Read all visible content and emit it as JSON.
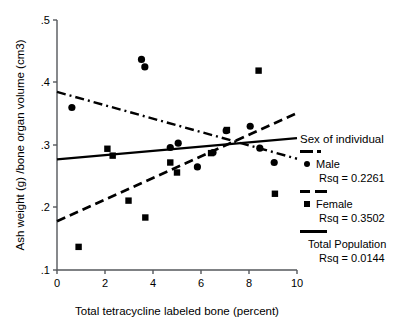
{
  "chart_data": {
    "type": "scatter",
    "title": "",
    "xlabel": "Total tetracycline labeled bone (percent)",
    "ylabel": "Ash weight (g) /bone organ volume (cm3)",
    "xlim": [
      0,
      10
    ],
    "ylim": [
      0.1,
      0.5
    ],
    "xticks": [
      "0",
      "2",
      "4",
      "6",
      "8",
      "10"
    ],
    "xtick_values": [
      0,
      2,
      4,
      6,
      8,
      10
    ],
    "yticks": [
      ".1",
      ".2",
      ".3",
      ".4",
      ".5"
    ],
    "ytick_values": [
      0.1,
      0.2,
      0.3,
      0.4,
      0.5
    ],
    "grid": false,
    "legend_position": "right",
    "series": [
      {
        "name": "Male",
        "marker": "circle",
        "points": [
          [
            0.62,
            0.36
          ],
          [
            3.52,
            0.437
          ],
          [
            3.66,
            0.425
          ],
          [
            4.72,
            0.296
          ],
          [
            5.05,
            0.303
          ],
          [
            5.85,
            0.265
          ],
          [
            6.5,
            0.288
          ],
          [
            7.05,
            0.323
          ],
          [
            8.05,
            0.33
          ],
          [
            8.45,
            0.295
          ],
          [
            9.05,
            0.272
          ]
        ],
        "fit": {
          "style": "dash-dot",
          "y_at_xmin": 0.385,
          "y_at_xmax": 0.278
        },
        "rsq_label": "Rsq = 0.2261"
      },
      {
        "name": "Female",
        "marker": "square",
        "points": [
          [
            0.9,
            0.137
          ],
          [
            2.1,
            0.294
          ],
          [
            2.32,
            0.283
          ],
          [
            2.98,
            0.211
          ],
          [
            3.68,
            0.184
          ],
          [
            4.72,
            0.272
          ],
          [
            5.0,
            0.256
          ],
          [
            6.42,
            0.287
          ],
          [
            7.08,
            0.324
          ],
          [
            8.4,
            0.419
          ],
          [
            9.08,
            0.222
          ]
        ],
        "fit": {
          "style": "dashed",
          "y_at_xmin": 0.178,
          "y_at_xmax": 0.351
        },
        "rsq_label": "Rsq = 0.3502"
      },
      {
        "name": "Total Population",
        "marker": "none",
        "points": [],
        "fit": {
          "style": "solid",
          "y_at_xmin": 0.277,
          "y_at_xmax": 0.311
        },
        "rsq_label": "Rsq = 0.0144"
      }
    ]
  },
  "legend": {
    "title": "Sex of individual",
    "entries": [
      {
        "swatch": "dash-dot",
        "label": "Male",
        "rsq": "Rsq = 0.2261"
      },
      {
        "swatch": "dashed",
        "label": "Female",
        "rsq": "Rsq = 0.3502"
      },
      {
        "swatch": "solid",
        "label": "Total Population",
        "rsq": "Rsq = 0.0144"
      }
    ]
  }
}
